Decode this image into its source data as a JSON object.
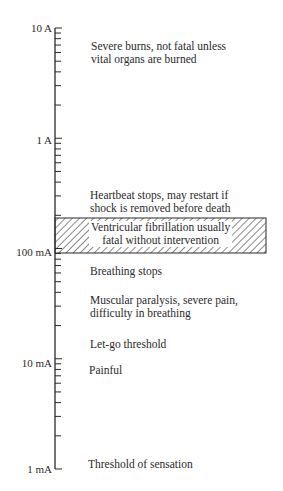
{
  "chart_data": {
    "type": "log-scale annotated diagram",
    "title": "",
    "axis": {
      "scale": "log10",
      "range": [
        "1 mA",
        "10 A"
      ],
      "tick_labels": [
        "10 A",
        "1 A",
        "100 mA",
        "10 mA",
        "1 mA"
      ],
      "decade_values_amps": [
        10,
        1,
        0.1,
        0.01,
        0.001
      ]
    },
    "annotations": [
      {
        "current_approx": "~5 A",
        "text": "Severe burns, not fatal unless vital organs are burned"
      },
      {
        "current_approx": "~0.2 A",
        "text": "Heartbeat stops, may restart if shock is removed before death"
      },
      {
        "range": [
          "100 mA",
          "~200 mA"
        ],
        "text": "Ventricular fibrillation usually fatal without intervention",
        "style": "hatched band"
      },
      {
        "current_approx": "~60 mA",
        "text": "Breathing stops"
      },
      {
        "current_approx": "~30 mA",
        "text": "Muscular paralysis, severe pain, difficulty in breathing"
      },
      {
        "current_approx": "~15 mA",
        "text": "Let-go threshold"
      },
      {
        "current_approx": "~8 mA",
        "text": "Painful"
      },
      {
        "current_approx": "1 mA",
        "text": "Threshold of sensation"
      }
    ]
  },
  "axis_labels": {
    "a10": "10 A",
    "a1": "1 A",
    "ma100": "100 mA",
    "ma10": "10 mA",
    "ma1": "1 mA"
  },
  "effects": {
    "burns_l1": "Severe burns, not fatal unless",
    "burns_l2": "vital organs are burned",
    "heart_l1": "Heartbeat stops, may restart if",
    "heart_l2": "shock is removed before death",
    "vfib_l1": "Ventricular fibrillation usually",
    "vfib_l2": "fatal without intervention",
    "breathing": "Breathing stops",
    "paralysis_l1": "Muscular paralysis, severe pain,",
    "paralysis_l2": "difficulty in breathing",
    "letgo": "Let-go threshold",
    "painful": "Painful",
    "sensation": "Threshold of sensation"
  },
  "colors": {
    "ink": "#2a2a2a",
    "background": "#ffffff"
  }
}
